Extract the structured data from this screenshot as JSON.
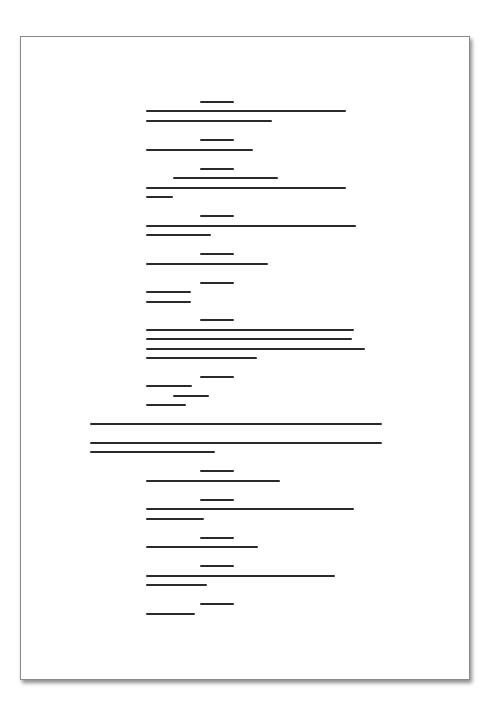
{
  "document": {
    "type": "redacted-page",
    "page": {
      "x": 20,
      "y": 36,
      "width": 450,
      "height": 644
    },
    "bar_color": "#2a2a2a",
    "lines": [
      {
        "x": 200,
        "y": 101,
        "w": 34
      },
      {
        "x": 146,
        "y": 110,
        "w": 200
      },
      {
        "x": 146,
        "y": 120,
        "w": 126
      },
      {
        "x": 200,
        "y": 139,
        "w": 34
      },
      {
        "x": 146,
        "y": 149,
        "w": 107
      },
      {
        "x": 200,
        "y": 168,
        "w": 34
      },
      {
        "x": 173,
        "y": 177,
        "w": 105
      },
      {
        "x": 146,
        "y": 187,
        "w": 200
      },
      {
        "x": 146,
        "y": 196,
        "w": 27
      },
      {
        "x": 200,
        "y": 215,
        "w": 34
      },
      {
        "x": 146,
        "y": 225,
        "w": 210
      },
      {
        "x": 146,
        "y": 234,
        "w": 65
      },
      {
        "x": 200,
        "y": 253,
        "w": 34
      },
      {
        "x": 146,
        "y": 263,
        "w": 122
      },
      {
        "x": 200,
        "y": 282,
        "w": 34
      },
      {
        "x": 146,
        "y": 291,
        "w": 45
      },
      {
        "x": 146,
        "y": 301,
        "w": 45
      },
      {
        "x": 200,
        "y": 319,
        "w": 34
      },
      {
        "x": 146,
        "y": 329,
        "w": 208
      },
      {
        "x": 146,
        "y": 338,
        "w": 206
      },
      {
        "x": 146,
        "y": 348,
        "w": 219
      },
      {
        "x": 146,
        "y": 357,
        "w": 111
      },
      {
        "x": 200,
        "y": 376,
        "w": 34
      },
      {
        "x": 146,
        "y": 385,
        "w": 46
      },
      {
        "x": 173,
        "y": 395,
        "w": 36
      },
      {
        "x": 146,
        "y": 404,
        "w": 40
      },
      {
        "x": 90,
        "y": 423,
        "w": 292
      },
      {
        "x": 90,
        "y": 442,
        "w": 292
      },
      {
        "x": 90,
        "y": 451,
        "w": 125
      },
      {
        "x": 200,
        "y": 470,
        "w": 34
      },
      {
        "x": 146,
        "y": 480,
        "w": 134
      },
      {
        "x": 200,
        "y": 499,
        "w": 34
      },
      {
        "x": 146,
        "y": 508,
        "w": 208
      },
      {
        "x": 146,
        "y": 518,
        "w": 58
      },
      {
        "x": 200,
        "y": 537,
        "w": 34
      },
      {
        "x": 146,
        "y": 546,
        "w": 112
      },
      {
        "x": 200,
        "y": 565,
        "w": 34
      },
      {
        "x": 146,
        "y": 575,
        "w": 189
      },
      {
        "x": 146,
        "y": 584,
        "w": 61
      },
      {
        "x": 200,
        "y": 603,
        "w": 34
      },
      {
        "x": 146,
        "y": 613,
        "w": 49
      }
    ]
  }
}
